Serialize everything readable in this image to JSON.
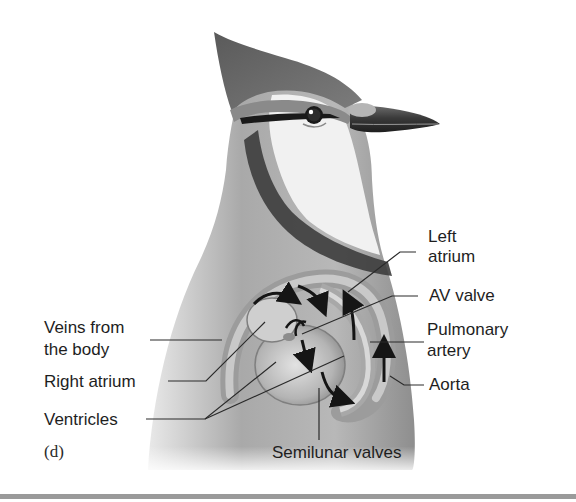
{
  "figure": {
    "panel_id": "(d)",
    "labels": {
      "left_atrium_line1": "Left",
      "left_atrium_line2": "atrium",
      "av_valve": "AV valve",
      "pulmonary_artery_line1": "Pulmonary",
      "pulmonary_artery_line2": "artery",
      "aorta": "Aorta",
      "veins_line1": "Veins from",
      "veins_line2": "the body",
      "right_atrium": "Right atrium",
      "ventricles": "Ventricles",
      "semilunar_valves": "Semilunar valves"
    }
  },
  "colors": {
    "text": "#1e1e1e",
    "leader_line": "#2a2a2a",
    "bottom_rule": "#9a9a9a"
  }
}
